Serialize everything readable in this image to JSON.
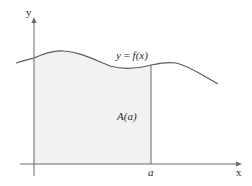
{
  "diagram": {
    "type": "area-under-curve",
    "axes": {
      "x_label": "x",
      "y_label": "y"
    },
    "curve_label": "y = f(x)",
    "curve_label_parts": {
      "lhs": "y",
      "eq": " = ",
      "rhs": "f(x)"
    },
    "area_label": "A(a)",
    "bound_label": "a",
    "colors": {
      "axis": "#6b6b6b",
      "curve": "#5a5a5a",
      "fill": "#f2f2f2",
      "text": "#2a2a2a"
    }
  }
}
